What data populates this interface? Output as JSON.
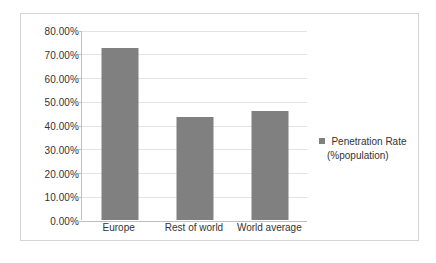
{
  "chart_data": {
    "type": "bar",
    "title": "",
    "subtitle": "",
    "xlabel": "",
    "ylabel": "",
    "categories": [
      "Europe",
      "Rest of world",
      "World average"
    ],
    "series": [
      {
        "name": "Penetration Rate (%population)",
        "values": [
          72.6,
          43.2,
          46.1
        ]
      }
    ],
    "values": [
      72.6,
      43.2,
      46.1
    ],
    "ylim": [
      0,
      80
    ],
    "ytick_step": 10,
    "ytick_labels": [
      "80.00%",
      "70.00%",
      "60.00%",
      "50.00%",
      "40.00%",
      "30.00%",
      "20.00%",
      "10.00%",
      "0.00%"
    ],
    "ytick_values": [
      80,
      70,
      60,
      50,
      40,
      30,
      20,
      10,
      0
    ],
    "grid": "horizontal",
    "legend_position": "right",
    "legend": [
      {
        "label_line1": "Penetration Rate",
        "label_line2": "(%population)",
        "marker": "square-swatch",
        "color": "#808080"
      }
    ],
    "annotations": []
  },
  "style": {
    "bar_color": "#808080",
    "gridline_color": "#e3e3e3",
    "axis_color": "#bfbfbf",
    "frame_border_color": "#d4d4d4",
    "text_color": "#333333",
    "background": "#ffffff"
  }
}
